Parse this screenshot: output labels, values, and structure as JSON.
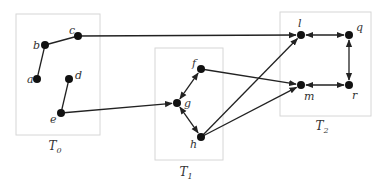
{
  "diagram": {
    "groups": [
      {
        "id": "T0",
        "label": "T",
        "sub": "0",
        "x": 16,
        "y": 14,
        "w": 84,
        "h": 121,
        "lx": 55,
        "ly": 150
      },
      {
        "id": "T1",
        "label": "T",
        "sub": "1",
        "x": 155,
        "y": 48,
        "w": 68,
        "h": 112,
        "lx": 186,
        "ly": 176
      },
      {
        "id": "T2",
        "label": "T",
        "sub": "2",
        "x": 280,
        "y": 12,
        "w": 91,
        "h": 104,
        "lx": 322,
        "ly": 130
      }
    ],
    "nodes": [
      {
        "id": "a",
        "label": "a",
        "x": 37,
        "y": 79,
        "lx": 27,
        "ly": 83
      },
      {
        "id": "b",
        "label": "b",
        "x": 45,
        "y": 45,
        "lx": 33,
        "ly": 49
      },
      {
        "id": "c",
        "label": "c",
        "x": 78,
        "y": 36,
        "lx": 69,
        "ly": 34
      },
      {
        "id": "d",
        "label": "d",
        "x": 69,
        "y": 79,
        "lx": 75,
        "ly": 79
      },
      {
        "id": "e",
        "label": "e",
        "x": 61,
        "y": 113,
        "lx": 50,
        "ly": 123
      },
      {
        "id": "f",
        "label": "f",
        "x": 201,
        "y": 69,
        "lx": 192,
        "ly": 67
      },
      {
        "id": "g",
        "label": "g",
        "x": 177,
        "y": 103,
        "lx": 184,
        "ly": 107
      },
      {
        "id": "h",
        "label": "h",
        "x": 201,
        "y": 137,
        "lx": 190,
        "ly": 148
      },
      {
        "id": "l",
        "label": "l",
        "x": 301,
        "y": 35,
        "lx": 298,
        "ly": 27
      },
      {
        "id": "m",
        "label": "m",
        "x": 301,
        "y": 85,
        "lx": 304,
        "ly": 100
      },
      {
        "id": "q",
        "label": "q",
        "x": 349,
        "y": 35,
        "lx": 356,
        "ly": 31
      },
      {
        "id": "r",
        "label": "r",
        "x": 349,
        "y": 85,
        "lx": 352,
        "ly": 99
      }
    ],
    "edges": [
      {
        "from": "a",
        "to": "b",
        "type": "line"
      },
      {
        "from": "b",
        "to": "c",
        "type": "line"
      },
      {
        "from": "d",
        "to": "e",
        "type": "line"
      },
      {
        "from": "c",
        "to": "l",
        "type": "arrow"
      },
      {
        "from": "e",
        "to": "g",
        "type": "arrow"
      },
      {
        "from": "g",
        "to": "f",
        "type": "bidirectional"
      },
      {
        "from": "g",
        "to": "h",
        "type": "bidirectional"
      },
      {
        "from": "f",
        "to": "m",
        "type": "arrow"
      },
      {
        "from": "h",
        "to": "l",
        "type": "arrow"
      },
      {
        "from": "h",
        "to": "m",
        "type": "arrow"
      },
      {
        "from": "l",
        "to": "q",
        "type": "bidirectional"
      },
      {
        "from": "q",
        "to": "r",
        "type": "bidirectional"
      },
      {
        "from": "m",
        "to": "r",
        "type": "bidirectional"
      }
    ]
  }
}
